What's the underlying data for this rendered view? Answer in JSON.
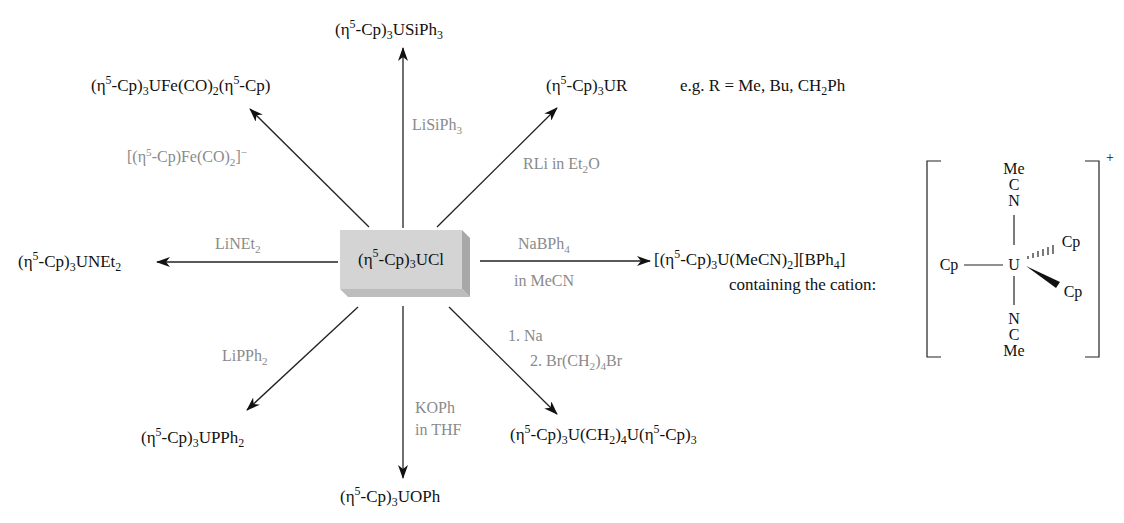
{
  "diagram": {
    "center": {
      "label_pre": "(η",
      "label_sup": "5",
      "label_mid": "-Cp)",
      "label_sub": "3",
      "label_post": "UCl",
      "box_colors": {
        "front": "#d4d4d4",
        "top": "#e6e6e6",
        "side": "#a8a8a8"
      }
    },
    "products": {
      "usiph3": {
        "a": "(η",
        "b": "5",
        "c": "-Cp)",
        "d": "3",
        "e": "USiPh",
        "f": "3"
      },
      "ufe": {
        "a": "(η",
        "b": "5",
        "c": "-Cp)",
        "d": "3",
        "e": "UFe(CO)",
        "f": "2",
        "g": "(η",
        "h": "5",
        "i": "-Cp)"
      },
      "ur": {
        "a": "(η",
        "b": "5",
        "c": "-Cp)",
        "d": "3",
        "e": "UR"
      },
      "ur_note": {
        "a": "e.g. R = Me, Bu, CH",
        "b": "2",
        "c": "Ph"
      },
      "unet2": {
        "a": "(η",
        "b": "5",
        "c": "-Cp)",
        "d": "3",
        "e": "UNEt",
        "f": "2"
      },
      "cation_salt": {
        "a": "[(η",
        "b": "5",
        "c": "-Cp)",
        "d": "3",
        "e": "U(MeCN)",
        "f": "2",
        "g": "][BPh",
        "h": "4",
        "i": "]"
      },
      "cation_note": "containing the cation:",
      "upph2": {
        "a": "(η",
        "b": "5",
        "c": "-Cp)",
        "d": "3",
        "e": "UPPh",
        "f": "2"
      },
      "uoph": {
        "a": "(η",
        "b": "5",
        "c": "-Cp)",
        "d": "3",
        "e": "UOPh"
      },
      "dimer": {
        "a": "(η",
        "b": "5",
        "c": "-Cp)",
        "d": "3",
        "e": "U(CH",
        "f": "2",
        "g": ")",
        "h": "4",
        "i": "U(η",
        "j": "5",
        "k": "-Cp)",
        "l": "3"
      }
    },
    "reagents": {
      "lisiph3": {
        "a": "LiSiPh",
        "b": "3"
      },
      "fe_anion": {
        "a": "[(η",
        "b": "5",
        "c": "-Cp)Fe(CO)",
        "d": "2",
        "e": "]",
        "f": "−"
      },
      "rli": {
        "a": "RLi in Et",
        "b": "2",
        "c": "O"
      },
      "linet2": {
        "a": "LiNEt",
        "b": "2"
      },
      "nabph4": {
        "a": "NaBPh",
        "b": "4"
      },
      "in_mecn": "in MeCN",
      "lipph2": {
        "a": "LiPPh",
        "b": "2"
      },
      "koph": "KOPh",
      "in_thf": "in THF",
      "step1": "1. Na",
      "step2": {
        "a": "2. Br(CH",
        "b": "2",
        "c": ")",
        "d": "4",
        "e": "Br"
      }
    },
    "cation_structure": {
      "metal": "U",
      "top_ligand": [
        "Me",
        "C",
        "N"
      ],
      "bottom_ligand": [
        "N",
        "C",
        "Me"
      ],
      "left_ligand": "Cp",
      "hashed_ligand": "Cp",
      "wedge_ligand": "Cp",
      "charge": "+"
    },
    "colors": {
      "product_text": "#111111",
      "reagent_text": "#8a8a8a",
      "arrow": "#222222"
    }
  }
}
